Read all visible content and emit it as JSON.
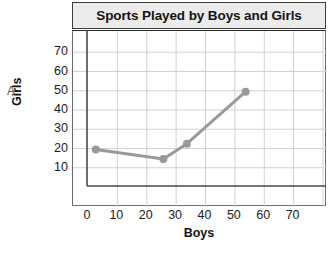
{
  "item_letter": "A.",
  "chart_data": {
    "type": "line",
    "title": "Sports Played by Boys and Girls",
    "xlabel": "Boys",
    "ylabel": "Girls",
    "xlim": [
      0,
      80
    ],
    "ylim": [
      0,
      80
    ],
    "xticks": [
      0,
      10,
      20,
      30,
      40,
      50,
      60,
      70
    ],
    "yticks": [
      10,
      20,
      30,
      40,
      50,
      60,
      70
    ],
    "grid": true,
    "legend": "none",
    "series": [
      {
        "name": "Sports played",
        "color": "#9a9a9a",
        "marker": "circle",
        "points": [
          {
            "x": 3,
            "y": 19
          },
          {
            "x": 26,
            "y": 14
          },
          {
            "x": 34,
            "y": 22
          },
          {
            "x": 54,
            "y": 49
          }
        ]
      }
    ]
  },
  "style": {
    "title_bg": "#ebebeb",
    "title_border": "#3c3c3c",
    "grid_color": "#d2d2d2",
    "axis_color": "#4a4a4a",
    "series_color": "#9a9a9a",
    "text_color": "#141414"
  }
}
